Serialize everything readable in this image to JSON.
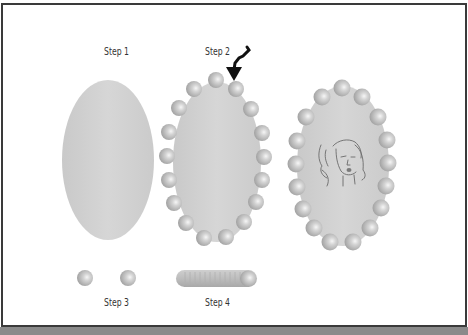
{
  "figure": {
    "labels": {
      "step1": "Step 1",
      "step2": "Step 2",
      "step3": "Step 3",
      "step4": "Step 4"
    },
    "colors": {
      "oval_fill": "#d0d0d0",
      "bead_light": "#f4f4f4",
      "bead_mid": "#c4c4c4",
      "bead_dark": "#9a9a9a",
      "arrow": "#111111",
      "frame_border": "#3a3a3a",
      "face_line": "#6a6a6a"
    },
    "steps": [
      {
        "id": 1,
        "description": "plain oval base"
      },
      {
        "id": 2,
        "description": "oval with beads around edge, arrow pointing to bead"
      },
      {
        "id": 3,
        "description": "two individual beads"
      },
      {
        "id": 4,
        "description": "strand of beads"
      },
      {
        "id": 5,
        "description": "finished beaded oval frame with face illustration"
      }
    ]
  }
}
